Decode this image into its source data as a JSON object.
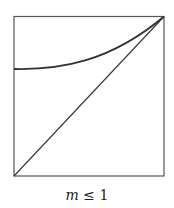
{
  "figure": {
    "caption_var": "m",
    "caption_rel": " ≤ 1",
    "caption": "m ≤ 1",
    "stroke_color": "#333333",
    "curves": [
      {
        "name": "convex-curve",
        "description": "curve from left edge at ~55% height rising to top-right corner"
      },
      {
        "name": "diagonal-line",
        "description": "straight line from bottom-left corner to top-right corner"
      }
    ]
  }
}
